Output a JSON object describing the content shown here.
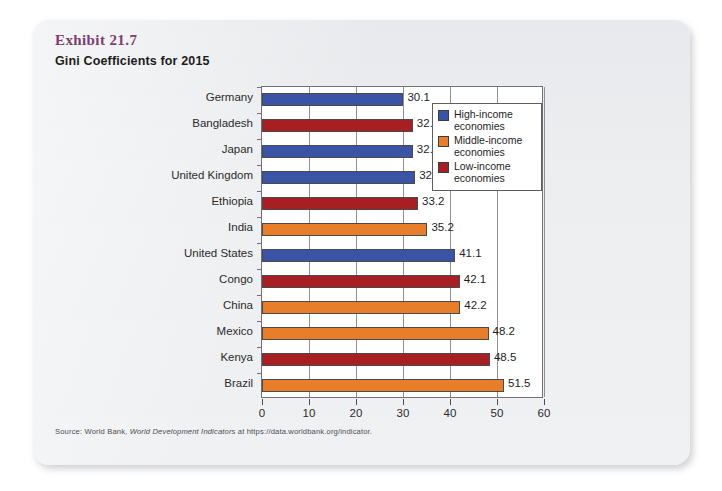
{
  "exhibit": {
    "label": "Exhibit 21.7",
    "title": "Gini Coefficients for 2015"
  },
  "source": {
    "prefix": "Source: World Bank, ",
    "italic": "World Development Indicators",
    "suffix": " at https://data.worldbank.org/indicator."
  },
  "colors": {
    "high_income": "#3b53a4",
    "middle_income": "#e87d2a",
    "low_income": "#a81f23",
    "exhibit_label": "#7b3f6d",
    "plot_border": "#6f7176",
    "gridline": "#8e9095",
    "card_background": "#eceef0"
  },
  "legend": {
    "position": "top-right",
    "items": [
      {
        "label": "High-income economies",
        "line1": "High-income",
        "line2": "economies",
        "color": "#3b53a4",
        "key": "high_income"
      },
      {
        "label": "Middle-income economies",
        "line1": "Middle-income",
        "line2": "economies",
        "color": "#e87d2a",
        "key": "middle_income"
      },
      {
        "label": "Low-income economies",
        "line1": "Low-income",
        "line2": "economies",
        "color": "#a81f23",
        "key": "low_income"
      }
    ]
  },
  "chart_data": {
    "type": "bar",
    "orientation": "horizontal",
    "title": "Gini Coefficients for 2015",
    "xlabel": "",
    "ylabel": "",
    "xlim": [
      0,
      60
    ],
    "xticks": [
      0,
      10,
      20,
      30,
      40,
      50,
      60
    ],
    "grid": true,
    "grid_axis": "x",
    "legend_position": "top-right",
    "categories": [
      "Germany",
      "Bangladesh",
      "Japan",
      "United Kingdom",
      "Ethiopia",
      "India",
      "United States",
      "Congo",
      "China",
      "Mexico",
      "Kenya",
      "Brazil"
    ],
    "values": [
      30.1,
      32.1,
      32.1,
      32.6,
      33.2,
      35.2,
      41.1,
      42.1,
      42.2,
      48.2,
      48.5,
      51.5
    ],
    "value_labels": [
      "30.1",
      "32.1",
      "32.1",
      "32.6",
      "33.2",
      "35.2",
      "41.1",
      "42.1",
      "42.2",
      "48.2",
      "48.5",
      "51.5"
    ],
    "groups": [
      "high_income",
      "low_income",
      "high_income",
      "high_income",
      "low_income",
      "middle_income",
      "high_income",
      "low_income",
      "middle_income",
      "middle_income",
      "low_income",
      "middle_income"
    ],
    "series": [
      {
        "name": "High-income economies",
        "color": "#3b53a4",
        "points": [
          {
            "category": "Germany",
            "value": 30.1
          },
          {
            "category": "Japan",
            "value": 32.1
          },
          {
            "category": "United Kingdom",
            "value": 32.6
          },
          {
            "category": "United States",
            "value": 41.1
          }
        ]
      },
      {
        "name": "Middle-income economies",
        "color": "#e87d2a",
        "points": [
          {
            "category": "India",
            "value": 35.2
          },
          {
            "category": "China",
            "value": 42.2
          },
          {
            "category": "Mexico",
            "value": 48.2
          },
          {
            "category": "Brazil",
            "value": 51.5
          }
        ]
      },
      {
        "name": "Low-income economies",
        "color": "#a81f23",
        "points": [
          {
            "category": "Bangladesh",
            "value": 32.1
          },
          {
            "category": "Ethiopia",
            "value": 33.2
          },
          {
            "category": "Congo",
            "value": 42.1
          },
          {
            "category": "Kenya",
            "value": 48.5
          }
        ]
      }
    ]
  }
}
